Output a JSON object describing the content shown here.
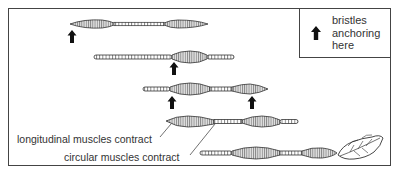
{
  "figure": {
    "colors": {
      "ink": "#333333",
      "fill": "#cfcfcf",
      "background": "#ffffff"
    }
  },
  "legend": {
    "icon": "up-arrow-icon",
    "lines": [
      "bristles",
      "anchoring",
      "here"
    ]
  },
  "labels": {
    "longitudinal": "longitudinal muscles contract",
    "circular": "circular muscles contract"
  },
  "stages": [
    {
      "id": 1,
      "anchors": 1
    },
    {
      "id": 2,
      "anchors": 1
    },
    {
      "id": 3,
      "anchors": 2
    },
    {
      "id": 4,
      "anchors": 0
    },
    {
      "id": 5,
      "anchors": 0,
      "note": "leaf at head"
    }
  ]
}
